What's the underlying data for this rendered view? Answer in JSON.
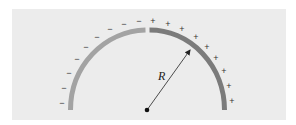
{
  "figure": {
    "radius_label": "R",
    "center_point": "charge-free center point",
    "left_arc": {
      "charge": "negative",
      "sign": "−",
      "count": 9,
      "color": "#a3a3a3"
    },
    "right_arc": {
      "charge": "positive",
      "sign": "+",
      "count": 9,
      "color": "#7b7b7b"
    },
    "panel_color": "#ececec"
  },
  "signs": {
    "minus": [
      {
        "x": 62,
        "y": 103
      },
      {
        "x": 64,
        "y": 88
      },
      {
        "x": 69,
        "y": 73
      },
      {
        "x": 77,
        "y": 59
      },
      {
        "x": 86,
        "y": 47
      },
      {
        "x": 97,
        "y": 37
      },
      {
        "x": 110,
        "y": 29
      },
      {
        "x": 124,
        "y": 24
      },
      {
        "x": 139,
        "y": 21
      }
    ],
    "plus": [
      {
        "x": 153,
        "y": 21
      },
      {
        "x": 168,
        "y": 24
      },
      {
        "x": 182,
        "y": 29
      },
      {
        "x": 196,
        "y": 37
      },
      {
        "x": 207,
        "y": 47
      },
      {
        "x": 216,
        "y": 58
      },
      {
        "x": 224,
        "y": 71
      },
      {
        "x": 229,
        "y": 86
      },
      {
        "x": 232,
        "y": 101
      }
    ]
  }
}
